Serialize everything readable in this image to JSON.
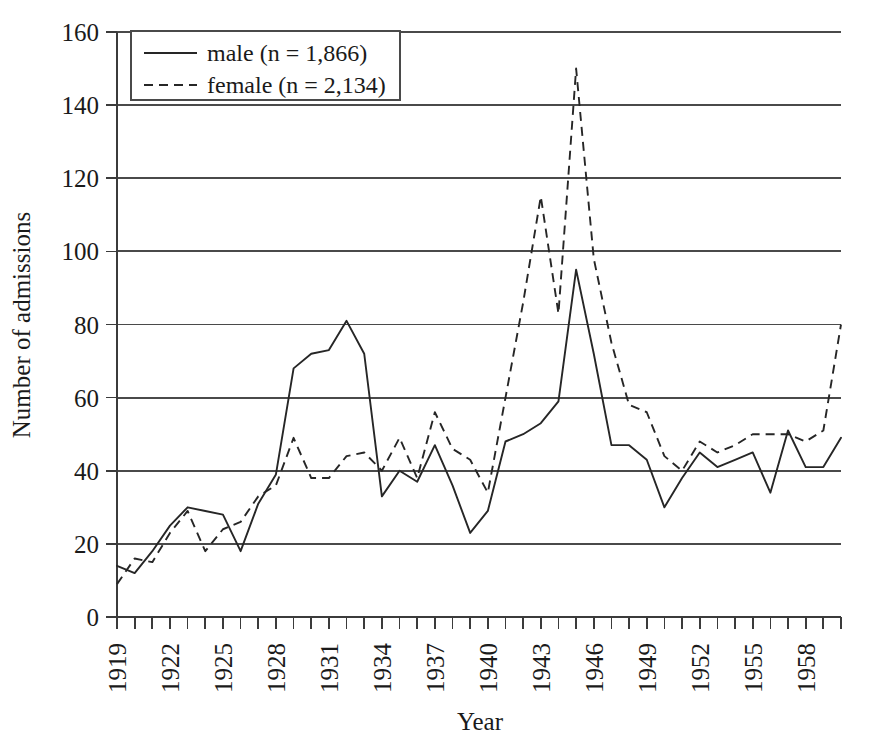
{
  "chart_data": {
    "type": "line",
    "title": "",
    "xlabel": "Year",
    "ylabel": "Number of admissions",
    "xlim": [
      1919,
      1960
    ],
    "ylim": [
      0,
      160
    ],
    "ytick_step": 20,
    "xtick_step": 1,
    "xtick_label_step": 3,
    "grid": "horizontal",
    "legend_position": "top-left",
    "yticks": [
      0,
      20,
      40,
      60,
      80,
      100,
      120,
      140,
      160
    ],
    "ytick_labels": [
      "0",
      "20",
      "40",
      "60",
      "80",
      "100",
      "120",
      "140",
      "160"
    ],
    "x": [
      1919,
      1920,
      1921,
      1922,
      1923,
      1924,
      1925,
      1926,
      1927,
      1928,
      1929,
      1930,
      1931,
      1932,
      1933,
      1934,
      1935,
      1936,
      1937,
      1938,
      1939,
      1940,
      1941,
      1942,
      1943,
      1944,
      1945,
      1946,
      1947,
      1948,
      1949,
      1950,
      1951,
      1952,
      1953,
      1954,
      1955,
      1956,
      1957,
      1958,
      1959,
      1960
    ],
    "xtick_labels": [
      "1919",
      "",
      "",
      "1922",
      "",
      "",
      "1925",
      "",
      "",
      "1928",
      "",
      "",
      "1931",
      "",
      "",
      "1934",
      "",
      "",
      "1937",
      "",
      "",
      "1940",
      "",
      "",
      "1943",
      "",
      "",
      "1946",
      "",
      "",
      "1949",
      "",
      "",
      "1952",
      "",
      "",
      "1955",
      "",
      "",
      "1958",
      "",
      ""
    ],
    "series": [
      {
        "name": "male (n = 1,866)",
        "key": "male",
        "style": "solid",
        "n": 1866,
        "values": [
          14,
          12,
          18,
          25,
          30,
          29,
          28,
          18,
          31,
          39,
          68,
          72,
          73,
          81,
          72,
          33,
          40,
          37,
          47,
          36,
          23,
          29,
          48,
          50,
          53,
          59,
          95,
          72,
          47,
          47,
          43,
          30,
          38,
          45,
          41,
          43,
          45,
          34,
          51,
          41,
          41,
          49
        ]
      },
      {
        "name": "female (n = 2,134)",
        "key": "female",
        "style": "dashed",
        "n": 2134,
        "values": [
          9,
          16,
          15,
          23,
          29,
          18,
          24,
          26,
          33,
          36,
          49,
          38,
          38,
          44,
          45,
          40,
          49,
          38,
          56,
          46,
          43,
          34,
          60,
          86,
          115,
          83,
          150,
          98,
          75,
          58,
          56,
          44,
          40,
          48,
          45,
          47,
          50,
          50,
          50,
          48,
          51,
          80
        ]
      }
    ]
  },
  "legend": {
    "entries": [
      {
        "label": "male (n = 1,866)",
        "style": "solid"
      },
      {
        "label": "female (n = 2,134)",
        "style": "dashed"
      }
    ]
  },
  "axis_titles": {
    "x": "Year",
    "y": "Number of admissions"
  }
}
